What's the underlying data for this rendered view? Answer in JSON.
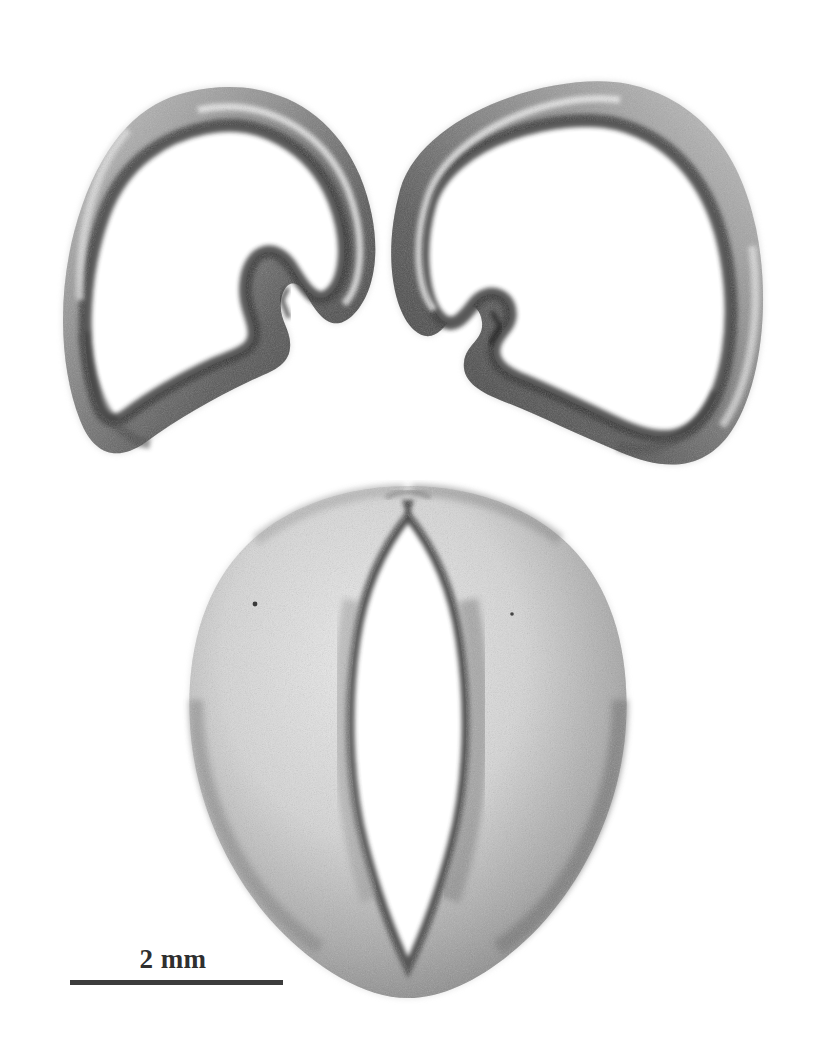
{
  "figure": {
    "kind": "specimen-photomicrograph",
    "background_color": "#ffffff",
    "media": "grayscale halftone photograph",
    "specimen_count": 3,
    "specimens": [
      {
        "id": "upper-left-valve",
        "label": "upper left valve",
        "description": "C-shaped ring-like valve with thick shaded rim, hollow pale interior and a hinge notch on its inner right margin"
      },
      {
        "id": "upper-right-valve",
        "label": "upper right valve",
        "description": "mirror image of the upper left valve, hinge notch on its inner left margin"
      },
      {
        "id": "lower-whole-specimen",
        "label": "lower whole specimen",
        "description": "heart to inverted-teardrop shaped body with a narrow pointed oval central opening and a small apical notch"
      }
    ]
  },
  "scale_bar": {
    "label": "2 mm",
    "value": 2,
    "unit": "mm",
    "bar_color": "#3c3c3c",
    "text_color": "#2f2f2f"
  }
}
